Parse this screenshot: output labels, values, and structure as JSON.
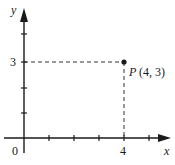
{
  "diagram": {
    "type": "coordinate-plane",
    "x_axis": {
      "label": "x",
      "origin_label": "0",
      "tick_label_4": "4"
    },
    "y_axis": {
      "label": "y",
      "tick_label_3": "3"
    },
    "point": {
      "name": "P",
      "coords_text": "(4, 3)",
      "x": 4,
      "y": 3
    },
    "colors": {
      "ink": "#1a1a1a",
      "background": "#ffffff"
    }
  }
}
